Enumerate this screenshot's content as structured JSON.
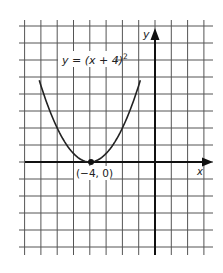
{
  "chart_data": {
    "type": "line",
    "title": "",
    "equation_label": "y = (x + 4)",
    "equation_exponent": "2",
    "xlabel": "x",
    "ylabel": "y",
    "xlim": [
      -8,
      4
    ],
    "ylim": [
      -10,
      16
    ],
    "grid": true,
    "x_grid_step": 1,
    "y_grid_step": 2,
    "series": [
      {
        "name": "y = (x + 4)^2",
        "x": [
          -7.1,
          -7,
          -6.5,
          -6,
          -5.5,
          -5,
          -4.5,
          -4,
          -3.5,
          -3,
          -2.5,
          -2,
          -1.5,
          -1,
          -0.9
        ],
        "y": [
          9.61,
          9,
          6.25,
          4,
          2.25,
          1,
          0.25,
          0,
          0.25,
          1,
          2.25,
          4,
          6.25,
          9,
          9.61
        ]
      }
    ],
    "annotations": [
      {
        "text": "(−4, 0)",
        "x": -4,
        "y": 0,
        "marker": "dot"
      }
    ]
  }
}
